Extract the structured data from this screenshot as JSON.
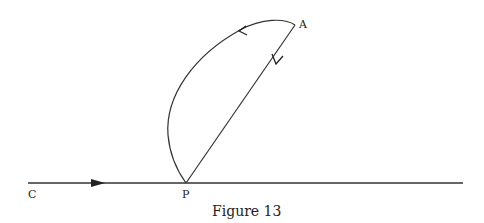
{
  "figure": {
    "caption": "Figure 13",
    "labels": {
      "A": "A",
      "P": "P",
      "C": "C"
    },
    "line_color": "#333333"
  }
}
